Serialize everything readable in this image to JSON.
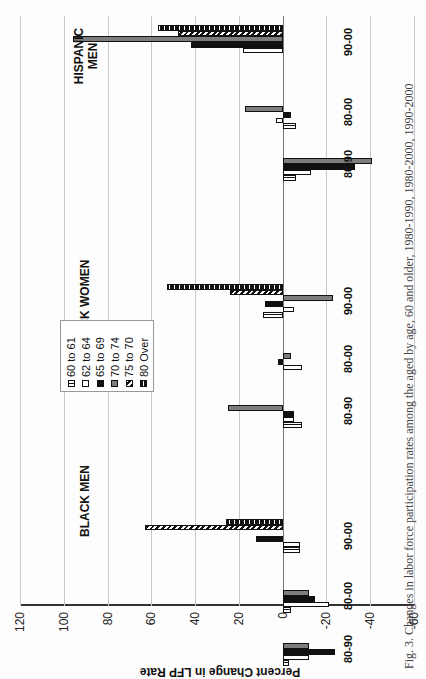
{
  "chart_data": {
    "type": "bar",
    "orientation": "rotated 90 degrees (page turned sideways)",
    "title": "",
    "ylabel": "Percent Change in LFP Rate",
    "xlabel": "",
    "ylim": [
      -60,
      120
    ],
    "yticks": [
      120,
      100,
      80,
      60,
      40,
      20,
      0,
      -20,
      -40,
      -60
    ],
    "grid": true,
    "legend_position": "upper-left inside plot",
    "groups": [
      "BLACK MEN",
      "BLACK WOMEN",
      "HISPANIC MEN"
    ],
    "categories": [
      "80-90",
      "80-00",
      "90-00",
      "80-90",
      "80-00",
      "90-00",
      "80-90",
      "80-00",
      "90-00"
    ],
    "series": [
      {
        "name": "60 to 61",
        "pattern": "vertical-stripes",
        "values": [
          -3,
          -4,
          -8,
          -9,
          0,
          9,
          -6,
          -6,
          0
        ]
      },
      {
        "name": "62 to 64",
        "pattern": "white",
        "values": [
          -12,
          -21,
          -8,
          -5,
          -9,
          -5,
          -13,
          3,
          18
        ]
      },
      {
        "name": "65 to 69",
        "pattern": "black",
        "values": [
          -24,
          -15,
          12,
          -5,
          2,
          8,
          -33,
          -4,
          42
        ]
      },
      {
        "name": "70 to 74",
        "pattern": "gray",
        "values": [
          -12,
          -12,
          0,
          25,
          -4,
          -23,
          -41,
          17,
          96
        ]
      },
      {
        "name": "75 to 70",
        "pattern": "diagonal-hatch",
        "values": [
          0,
          0,
          63,
          0,
          0,
          24,
          0,
          0,
          48
        ]
      },
      {
        "name": "80 Over",
        "pattern": "dotted-hatch",
        "values": [
          0,
          0,
          26,
          0,
          0,
          53,
          0,
          0,
          57
        ]
      }
    ]
  },
  "axis": {
    "ticks": [
      "120",
      "100",
      "80",
      "60",
      "40",
      "20",
      "0",
      "-20",
      "-40",
      "-60"
    ],
    "title": "Percent Change in LFP Rate"
  },
  "groups": {
    "black_men": "BLACK MEN",
    "black_women": "BLACK WOMEN",
    "hispanic_men_1": "HISPANIC",
    "hispanic_men_2": "MEN"
  },
  "categories": [
    "80-90",
    "80-00",
    "90-00",
    "80-90",
    "80-00",
    "90-00",
    "80-90",
    "80-00",
    "90-00"
  ],
  "legend": [
    "60 to 61",
    "62 to 64",
    "65 to 69",
    "70 to 74",
    "75 to 70",
    "80 Over"
  ],
  "caption": "Fig. 3. Changes in labor force participation rates among the aged by age, 60 and older, 1980-1990, 1980-2000, 1990-2000"
}
